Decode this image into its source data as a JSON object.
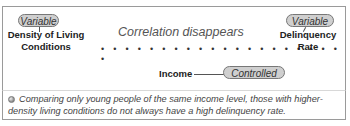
{
  "diagram": {
    "title": "Correlation disappears",
    "left_node": {
      "badge": "Variable",
      "label_line1": "Density of Living",
      "label_line2": "Conditions"
    },
    "right_node": {
      "badge": "Variable",
      "label_line1": "Delinquency",
      "label_line2": "Rate"
    },
    "control_node": {
      "label": "Income",
      "badge": "Controlled"
    },
    "dots": "• • • • • • • • • • • • • • • • • • • • •",
    "note": "Comparing only young people of the same income level, those with higher-density living conditions do not always have a high delinquency rate.",
    "note_icon": "bullet-icon"
  }
}
